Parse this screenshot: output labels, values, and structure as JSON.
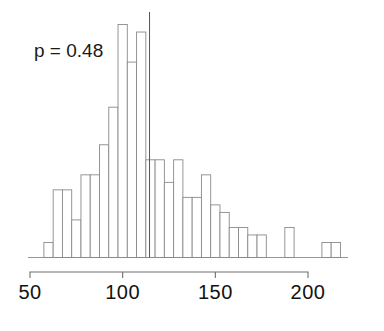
{
  "figure": {
    "name": "histogram-figure",
    "annotation": "p = 0.48",
    "background_color": "#ffffff",
    "bar_fill_color": "#ffffff",
    "bar_stroke_color": "#8a8a8a",
    "axis_color": "#6e6e6e",
    "text_color": "#1a1a1a"
  },
  "chart_data": {
    "type": "bar",
    "title": "",
    "subtitle": "",
    "xlabel": "",
    "ylabel": "",
    "annotations": [
      {
        "text": "p = 0.48",
        "x": 62,
        "y_frac": 0.88
      }
    ],
    "grid": false,
    "legend": null,
    "xlim": [
      50,
      215
    ],
    "ylim": [
      0,
      32
    ],
    "xticks": [
      50,
      100,
      150,
      200
    ],
    "xticklabels": [
      "50",
      "100",
      "150",
      "200"
    ],
    "yticks": [],
    "yticklabels": [],
    "bin_width": 5,
    "bin_starts": [
      57.5,
      62.5,
      67.5,
      72.5,
      77.5,
      82.5,
      87.5,
      92.5,
      97.5,
      102.5,
      107.5,
      112.5,
      117.5,
      122.5,
      127.5,
      132.5,
      137.5,
      142.5,
      147.5,
      152.5,
      157.5,
      162.5,
      167.5,
      172.5,
      177.5,
      182.5,
      187.5,
      192.5,
      197.5,
      202.5,
      207.5,
      212.5
    ],
    "categories": [
      "57.5",
      "62.5",
      "67.5",
      "72.5",
      "77.5",
      "82.5",
      "87.5",
      "92.5",
      "97.5",
      "102.5",
      "107.5",
      "112.5",
      "117.5",
      "122.5",
      "127.5",
      "132.5",
      "137.5",
      "142.5",
      "147.5",
      "152.5",
      "157.5",
      "162.5",
      "167.5",
      "172.5",
      "177.5",
      "182.5",
      "187.5",
      "192.5",
      "197.5",
      "202.5",
      "207.5",
      "212.5"
    ],
    "values": [
      2,
      9,
      9,
      5,
      11,
      11,
      15,
      20,
      31,
      26,
      30,
      13,
      13,
      10,
      13,
      8,
      8,
      11,
      7,
      6,
      4,
      4,
      3,
      3,
      0,
      0,
      4,
      0,
      0,
      0,
      2,
      2
    ],
    "reference_line": {
      "x": 114.5,
      "label": ""
    }
  }
}
